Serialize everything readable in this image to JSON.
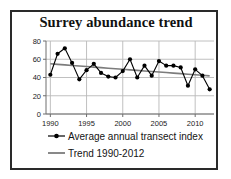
{
  "figure": {
    "title": "Surrey abundance trend",
    "border_color": "#2a2a2a",
    "background": "#ffffff"
  },
  "chart_data": {
    "type": "line",
    "title": "Surrey abundance trend",
    "xlabel": "",
    "ylabel": "",
    "xlim": [
      1989.4,
      2012.6
    ],
    "ylim": [
      0,
      80
    ],
    "grid": true,
    "legend_position": "bottom-left",
    "x": [
      1990,
      1991,
      1992,
      1993,
      1994,
      1995,
      1996,
      1997,
      1998,
      1999,
      2000,
      2001,
      2002,
      2003,
      2004,
      2005,
      2006,
      2007,
      2008,
      2009,
      2010,
      2011,
      2012
    ],
    "xticks": [
      1990,
      1995,
      2000,
      2005,
      2010
    ],
    "xtick_labels": [
      "1990",
      "1995",
      "2000",
      "2005",
      "2010"
    ],
    "yticks": [
      0,
      20,
      40,
      60,
      80
    ],
    "ytick_labels": [
      "0",
      "20",
      "40",
      "60",
      "80"
    ],
    "series": [
      {
        "name": "Average annual transect index",
        "style": "line-marker",
        "color": "#000000",
        "marker": "circle",
        "values": [
          43,
          66,
          72,
          56,
          38,
          48,
          55,
          45,
          41,
          40,
          47,
          60,
          40,
          53,
          42,
          58,
          53,
          53,
          51,
          31,
          49,
          42,
          27
        ]
      },
      {
        "name": "Trend 1990-2012",
        "style": "line",
        "color": "#7c7c7c",
        "marker": "none",
        "values": [
          55.0,
          54.4,
          53.8,
          53.2,
          52.6,
          52.0,
          51.4,
          50.8,
          50.2,
          49.6,
          49.0,
          48.4,
          47.8,
          47.2,
          46.6,
          46.0,
          45.4,
          44.8,
          44.2,
          43.6,
          43.0,
          42.4,
          41.8
        ]
      }
    ]
  },
  "legend": {
    "items": [
      {
        "label": "Average annual transect index",
        "marker": "line-with-dot",
        "color": "#000000"
      },
      {
        "label": "Trend 1990-2012",
        "marker": "line",
        "color": "#7c7c7c"
      }
    ]
  },
  "colors": {
    "series_line": "#000000",
    "trend_line": "#7c7c7c",
    "grid": "#b9b9b9",
    "axis": "#6e6e6e",
    "text": "#141414"
  }
}
